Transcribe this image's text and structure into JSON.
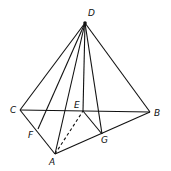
{
  "diagram": {
    "points": {
      "D": {
        "label": "D",
        "x": 85,
        "y": 23,
        "lx": 88,
        "ly": 16
      },
      "C": {
        "label": "C",
        "x": 20,
        "y": 110,
        "lx": 10,
        "ly": 113
      },
      "B": {
        "label": "B",
        "x": 150,
        "y": 112,
        "lx": 154,
        "ly": 116
      },
      "E": {
        "label": "E",
        "x": 83,
        "y": 111,
        "lx": 74,
        "ly": 108
      },
      "A": {
        "label": "A",
        "x": 55,
        "y": 154,
        "lx": 49,
        "ly": 165
      },
      "F": {
        "label": "F",
        "x": 38,
        "y": 129,
        "lx": 28,
        "ly": 138
      },
      "G": {
        "label": "G",
        "x": 102,
        "y": 134,
        "lx": 101,
        "ly": 143
      }
    },
    "edges_solid": [
      [
        "D",
        "C"
      ],
      [
        "D",
        "B"
      ],
      [
        "D",
        "A"
      ],
      [
        "D",
        "F"
      ],
      [
        "D",
        "E"
      ],
      [
        "D",
        "G"
      ],
      [
        "C",
        "B"
      ],
      [
        "C",
        "A"
      ],
      [
        "A",
        "B"
      ],
      [
        "E",
        "G"
      ]
    ],
    "edges_dashed": [
      [
        "A",
        "E"
      ]
    ],
    "stroke_color": "#111111",
    "background": "#ffffff"
  }
}
